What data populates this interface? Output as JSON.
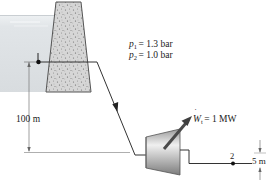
{
  "diagram": {
    "colors": {
      "water": "#dfe3e6",
      "water_surface": "#f4f6f7",
      "dam_fill": "#d4d4d4",
      "dam_stroke": "#555555",
      "line": "#333333",
      "turbine_light": "#f2f2f2",
      "turbine_dark": "#8a8a8a",
      "work_arrow": "#4a4a4a"
    },
    "state_points": [
      {
        "id": "1",
        "label": "1"
      },
      {
        "id": "2",
        "label": "2"
      }
    ],
    "pressures": {
      "p1": {
        "symbol": "p",
        "sub": "1",
        "value": "= 1.3 bar"
      },
      "p2": {
        "symbol": "p",
        "sub": "2",
        "value": "= 1.0 bar"
      }
    },
    "work": {
      "symbol": "W",
      "sub": "t",
      "value": "= 1 MW"
    },
    "dimensions": {
      "head": "100 m",
      "outlet": "5 m"
    },
    "components": [
      "reservoir",
      "dam",
      "penstock",
      "turbine",
      "outlet"
    ]
  }
}
